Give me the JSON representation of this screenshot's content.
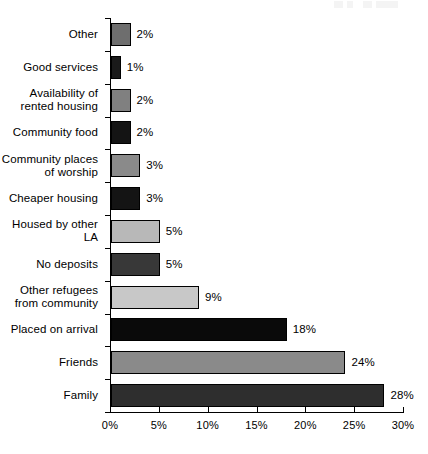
{
  "chart_data": {
    "type": "bar",
    "orientation": "horizontal",
    "title": "",
    "subtitle": "",
    "xlabel": "",
    "ylabel": "",
    "xlim": [
      0,
      30
    ],
    "grid": false,
    "legend": "none",
    "xticks": [
      "0%",
      "5%",
      "10%",
      "15%",
      "20%",
      "25%",
      "30%"
    ],
    "xtick_values": [
      0,
      5,
      10,
      15,
      20,
      25,
      30
    ],
    "categories": [
      "Other",
      "Good services",
      "Availability of\nrented housing",
      "Community food",
      "Community places\nof worship",
      "Cheaper housing",
      "Housed by other\nLA",
      "No deposits",
      "Other refugees\nfrom community",
      "Placed on arrival",
      "Friends",
      "Family"
    ],
    "values": [
      2,
      1,
      2,
      2,
      3,
      3,
      5,
      5,
      9,
      18,
      24,
      28
    ],
    "value_labels": [
      "2%",
      "1%",
      "2%",
      "2%",
      "3%",
      "3%",
      "5%",
      "5%",
      "9%",
      "18%",
      "24%",
      "28%"
    ],
    "bar_colors": [
      "#6e6e6e",
      "#1a1a1a",
      "#808080",
      "#141414",
      "#8a8a8a",
      "#141414",
      "#b8b8b8",
      "#383838",
      "#c8c8c8",
      "#0a0a0a",
      "#8a8a8a",
      "#2e2e2e"
    ],
    "axis_color": "#000000",
    "background_color": "#ffffff"
  }
}
